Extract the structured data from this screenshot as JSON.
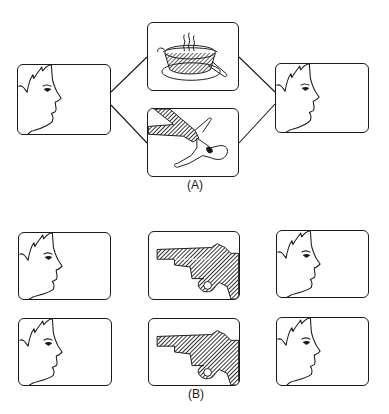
{
  "figure": {
    "panel_a": {
      "caption": "(A)",
      "frames": [
        {
          "id": "a-left",
          "content": "face-profile",
          "x": 17,
          "y": 64,
          "w": 94,
          "h": 71
        },
        {
          "id": "a-top",
          "content": "steaming-pot",
          "x": 147,
          "y": 22,
          "w": 92,
          "h": 69
        },
        {
          "id": "a-bottom",
          "content": "doll-with-hand",
          "x": 147,
          "y": 108,
          "w": 92,
          "h": 69
        },
        {
          "id": "a-right",
          "content": "face-profile",
          "x": 275,
          "y": 63,
          "w": 94,
          "h": 70
        }
      ],
      "caption_pos": {
        "x": 195,
        "y": 178
      }
    },
    "panel_b": {
      "caption": "(B)",
      "rows": [
        [
          {
            "id": "b-r1-left",
            "content": "face-profile",
            "x": 18,
            "y": 232,
            "w": 93,
            "h": 68
          },
          {
            "id": "b-r1-mid",
            "content": "revolver",
            "x": 148,
            "y": 231,
            "w": 92,
            "h": 69
          },
          {
            "id": "b-r1-right",
            "content": "face-profile",
            "x": 276,
            "y": 230,
            "w": 93,
            "h": 68
          }
        ],
        [
          {
            "id": "b-r2-left",
            "content": "face-profile",
            "x": 18,
            "y": 318,
            "w": 94,
            "h": 68
          },
          {
            "id": "b-r2-mid",
            "content": "revolver",
            "x": 148,
            "y": 318,
            "w": 92,
            "h": 68
          },
          {
            "id": "b-r2-right",
            "content": "face-profile",
            "x": 276,
            "y": 317,
            "w": 93,
            "h": 69
          }
        ]
      ],
      "caption_pos": {
        "x": 196,
        "y": 387
      }
    },
    "colors": {
      "ink": "#1a1a1a",
      "paper": "#ffffff",
      "hatch": "#3a3a3a"
    }
  }
}
